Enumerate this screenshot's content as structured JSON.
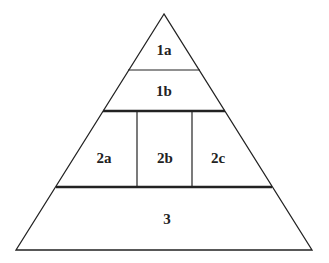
{
  "diagram": {
    "type": "pyramid",
    "colors": {
      "line": "#222222",
      "background": "#ffffff",
      "text": "#222222"
    },
    "geometry": {
      "apex": [
        164,
        14
      ],
      "base_left": [
        16,
        250
      ],
      "base_right": [
        312,
        250
      ]
    },
    "dividers": [
      {
        "name": "divider-1a-1b",
        "y": 70,
        "x1": 128,
        "x2": 200,
        "weight": "thin"
      },
      {
        "name": "divider-1-2",
        "y": 111,
        "x1": 103,
        "x2": 225,
        "weight": "thick"
      },
      {
        "name": "divider-2-3",
        "y": 187,
        "x1": 56,
        "x2": 272,
        "weight": "thick"
      }
    ],
    "vertical_dividers": [
      {
        "name": "divider-2a-2b",
        "x": 137,
        "y1": 111,
        "y2": 187
      },
      {
        "name": "divider-2b-2c",
        "x": 192,
        "y1": 111,
        "y2": 187
      }
    ],
    "sections": [
      {
        "id": "1a",
        "label": "1a",
        "x": 164,
        "y": 55
      },
      {
        "id": "1b",
        "label": "1b",
        "x": 164,
        "y": 96
      },
      {
        "id": "2a",
        "label": "2a",
        "x": 104,
        "y": 163
      },
      {
        "id": "2b",
        "label": "2b",
        "x": 165,
        "y": 163
      },
      {
        "id": "2c",
        "label": "2c",
        "x": 218,
        "y": 163
      },
      {
        "id": "3",
        "label": "3",
        "x": 167,
        "y": 224
      }
    ]
  }
}
